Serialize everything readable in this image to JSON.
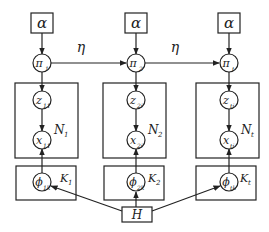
{
  "diagram": {
    "type": "plate-notation graphical model",
    "hyperparameter_alpha": "α",
    "transition_label": "η",
    "base_measure": "H",
    "columns": [
      {
        "pi": "π",
        "pi_sub": "1",
        "z": "z",
        "z_sub": "11",
        "x": "x",
        "x_sub": "11",
        "phi": "ϕ",
        "phi_sub": "1k",
        "N": "N",
        "N_sub": "1",
        "K": "K",
        "K_sub": "1"
      },
      {
        "pi": "π",
        "pi_sub": "2",
        "z": "z",
        "z_sub": "2i",
        "x": "x",
        "x_sub": "2i",
        "phi": "ϕ",
        "phi_sub": "2k",
        "N": "N",
        "N_sub": "2",
        "K": "K",
        "K_sub": "2"
      },
      {
        "pi": "π",
        "pi_sub": "t",
        "z": "z",
        "z_sub": "ti",
        "x": "x",
        "x_sub": "ti",
        "phi": "ϕ",
        "phi_sub": "tk",
        "N": "N",
        "N_sub": "t",
        "K": "K",
        "K_sub": "t"
      }
    ]
  }
}
